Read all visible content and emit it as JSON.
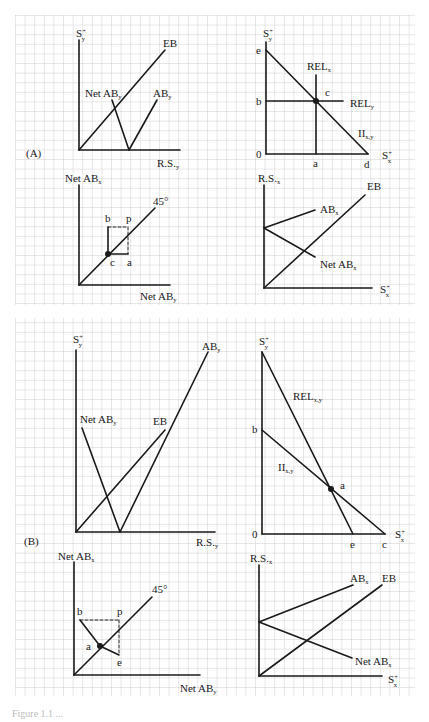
{
  "figure": {
    "caption_fragment": "Figure 1.1 ...",
    "grid_color": "#b8b8b8",
    "ink_color": "#1a1a1a"
  },
  "panel_a": {
    "label": "(A)",
    "top_left": {
      "y_axis": "S",
      "y_axis_sub": "y",
      "x_axis": "R.S.",
      "x_axis_sub": "y",
      "curves": {
        "eb": "EB",
        "net_ab": "Net AB",
        "net_ab_sub": "y",
        "ab": "AB",
        "ab_sub": "y"
      }
    },
    "top_right": {
      "y_axis": "S",
      "y_axis_sub": "y",
      "x_axis": "S",
      "x_axis_sub": "x",
      "points": {
        "e": "e",
        "b": "b",
        "origin": "0",
        "a": "a",
        "d": "d",
        "c": "c"
      },
      "curves": {
        "rel_x": "REL",
        "rel_x_sub": "x",
        "rel_y": "REL",
        "rel_y_sub": "y",
        "ii": "II",
        "ii_sub": "x,y"
      }
    },
    "bottom_left": {
      "y_axis": "Net AB",
      "y_axis_sub": "x",
      "x_axis": "Net AB",
      "x_axis_sub": "y",
      "line": "45°",
      "points": {
        "b": "b",
        "p": "p",
        "c": "c",
        "a": "a"
      }
    },
    "bottom_right": {
      "y_axis": "R.S.",
      "y_axis_sub": "x",
      "x_axis": "S",
      "x_axis_sub": "x",
      "curves": {
        "eb": "EB",
        "ab": "AB",
        "ab_sub": "x",
        "net_ab": "Net AB",
        "net_ab_sub": "x"
      }
    }
  },
  "panel_b": {
    "label": "(B)",
    "top_left": {
      "y_axis": "S",
      "y_axis_sub": "y",
      "x_axis": "R.S.",
      "x_axis_sub": "y",
      "curves": {
        "ab": "AB",
        "ab_sub": "y",
        "net_ab": "Net AB",
        "net_ab_sub": "y",
        "eb": "EB"
      }
    },
    "top_right": {
      "y_axis": "S",
      "y_axis_sub": "y",
      "x_axis": "S",
      "x_axis_sub": "x",
      "points": {
        "b": "b",
        "origin": "0",
        "e": "e",
        "c": "c",
        "a": "a"
      },
      "curves": {
        "rel": "REL",
        "rel_sub": "x,y",
        "ii": "II",
        "ii_sub": "x,y"
      }
    },
    "bottom_left": {
      "y_axis": "Net AB",
      "y_axis_sub": "x",
      "x_axis": "Net AB",
      "x_axis_sub": "y",
      "line": "45°",
      "points": {
        "b": "b",
        "p": "p",
        "a": "a",
        "e": "e"
      }
    },
    "bottom_right": {
      "y_axis": "R.S.",
      "y_axis_sub": "x",
      "x_axis": "S",
      "x_axis_sub": "x",
      "curves": {
        "ab": "AB",
        "ab_sub": "x",
        "eb": "EB",
        "net_ab": "Net AB",
        "net_ab_sub": "x"
      }
    }
  }
}
